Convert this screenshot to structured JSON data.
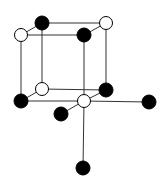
{
  "diagram": {
    "type": "crystal-structure",
    "colors": {
      "black_atom": "#000000",
      "white_atom": "#ffffff",
      "bond": "#333333",
      "background": "#ffffff"
    },
    "atoms": [
      {
        "id": "top-back-left",
        "x": 42,
        "y": 23,
        "r": 7,
        "color": "black"
      },
      {
        "id": "top-back-right",
        "x": 106,
        "y": 23,
        "r": 6.5,
        "color": "white"
      },
      {
        "id": "top-front-left",
        "x": 21,
        "y": 35,
        "r": 6.5,
        "color": "white"
      },
      {
        "id": "top-front-right",
        "x": 84,
        "y": 35,
        "r": 7,
        "color": "black"
      },
      {
        "id": "bottom-back-left",
        "x": 42,
        "y": 89,
        "r": 6.5,
        "color": "white"
      },
      {
        "id": "bottom-back-right",
        "x": 106,
        "y": 90,
        "r": 7,
        "color": "black"
      },
      {
        "id": "bottom-front-left",
        "x": 21,
        "y": 101,
        "r": 7,
        "color": "black"
      },
      {
        "id": "bottom-front-right",
        "x": 84,
        "y": 101,
        "r": 6.5,
        "color": "white"
      },
      {
        "id": "extra-front",
        "x": 61,
        "y": 114,
        "r": 7,
        "color": "black"
      },
      {
        "id": "extra-right",
        "x": 149,
        "y": 102,
        "r": 7,
        "color": "black"
      },
      {
        "id": "extra-bottom",
        "x": 83,
        "y": 168,
        "r": 7,
        "color": "black"
      }
    ],
    "bonds": [
      [
        "top-back-left",
        "top-back-right"
      ],
      [
        "top-front-left",
        "top-front-right"
      ],
      [
        "top-back-left",
        "top-front-left"
      ],
      [
        "top-back-right",
        "top-front-right"
      ],
      [
        "top-back-left",
        "bottom-back-left"
      ],
      [
        "top-front-left",
        "bottom-front-left"
      ],
      [
        "top-back-right",
        "bottom-back-right"
      ],
      [
        "top-front-right",
        "bottom-front-right"
      ],
      [
        "bottom-back-left",
        "bottom-back-right"
      ],
      [
        "bottom-front-left",
        "bottom-front-right"
      ],
      [
        "bottom-back-left",
        "bottom-front-left"
      ],
      [
        "bottom-back-right",
        "bottom-front-right"
      ],
      [
        "bottom-front-right",
        "extra-front"
      ],
      [
        "bottom-front-right",
        "extra-right"
      ],
      [
        "bottom-front-right",
        "extra-bottom"
      ]
    ]
  }
}
